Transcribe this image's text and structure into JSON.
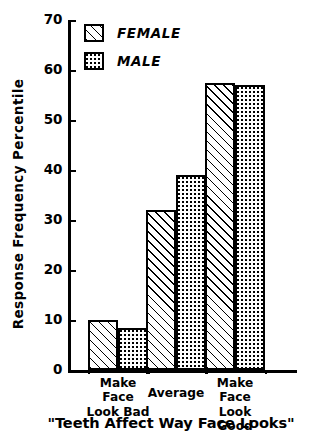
{
  "chart_data": {
    "type": "bar",
    "title": "\"Teeth Affect Way Face Looks\"",
    "xlabel": "\"Teeth Affect Way Face Looks\"",
    "ylabel": "Response Frequency Percentile",
    "categories": [
      "Make Face\nLook Bad",
      "Average",
      "Make Face\nLook Good"
    ],
    "series": [
      {
        "name": "FEMALE",
        "pattern": "diagonal-hatch",
        "values": [
          10,
          32,
          57.5
        ]
      },
      {
        "name": "MALE",
        "pattern": "dotted-stipple",
        "values": [
          8.5,
          39,
          57
        ]
      }
    ],
    "ylim": [
      0,
      70
    ],
    "yticks": [
      0,
      10,
      20,
      30,
      40,
      50,
      60,
      70
    ],
    "ytick_labels": [
      "0",
      "10",
      "20",
      "30",
      "40",
      "50",
      "60",
      "70"
    ],
    "grid": false,
    "legend_position": "top-left-inside",
    "colors": {
      "ink": "#000000",
      "background": "#ffffff"
    }
  },
  "legend": {
    "entries": [
      {
        "label": "FEMALE"
      },
      {
        "label": "MALE"
      }
    ]
  },
  "axis": {
    "y_title": "Response Frequency Percentile",
    "x_title": "\"Teeth Affect Way Face Looks\""
  }
}
